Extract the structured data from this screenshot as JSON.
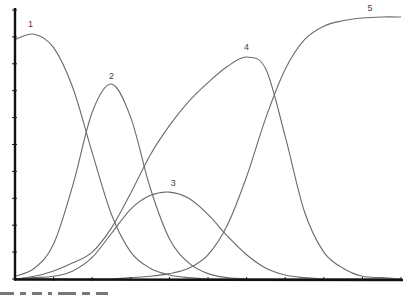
{
  "chart_data": {
    "type": "line",
    "title": "",
    "xlabel": "",
    "ylabel": "",
    "xlim": [
      0,
      10
    ],
    "ylim": [
      0,
      10
    ],
    "x_ticks": [
      0,
      1,
      2,
      3,
      4,
      5,
      6,
      7,
      8,
      9,
      10
    ],
    "y_ticks": [
      0,
      1,
      2,
      3,
      4,
      5,
      6,
      7,
      8,
      9,
      10
    ],
    "grid": false,
    "legend": "none (curves labeled inline 1-5)",
    "x": [
      0,
      0.5,
      1,
      1.5,
      2,
      2.5,
      3,
      3.5,
      4,
      4.5,
      5,
      5.5,
      6,
      6.5,
      7,
      7.5,
      8,
      8.5,
      9,
      9.5,
      10
    ],
    "series": [
      {
        "name": "1",
        "label_pos": [
          0.4,
          9.35
        ],
        "values": [
          8.9,
          9.1,
          8.6,
          7.1,
          4.7,
          2.4,
          1.0,
          0.4,
          0.15,
          0.05,
          0.0,
          0.0,
          0.0,
          0.0,
          0.0,
          0.0,
          0.0,
          0.0,
          0.0,
          0.0,
          0.0
        ]
      },
      {
        "name": "2",
        "label_pos": [
          2.5,
          7.45
        ],
        "values": [
          0.1,
          0.4,
          1.3,
          3.5,
          6.2,
          7.25,
          6.0,
          3.4,
          1.5,
          0.6,
          0.2,
          0.05,
          0.0,
          0.0,
          0.0,
          0.0,
          0.0,
          0.0,
          0.0,
          0.0,
          0.0
        ]
      },
      {
        "name": "3",
        "label_pos": [
          4.1,
          3.45
        ],
        "values": [
          0.0,
          0.05,
          0.1,
          0.3,
          0.8,
          1.7,
          2.6,
          3.1,
          3.23,
          3.0,
          2.4,
          1.6,
          0.9,
          0.4,
          0.15,
          0.05,
          0.0,
          0.0,
          0.0,
          0.0,
          0.0
        ]
      },
      {
        "name": "4",
        "label_pos": [
          6.0,
          8.5
        ],
        "values": [
          0.0,
          0.1,
          0.3,
          0.6,
          1.0,
          1.9,
          3.2,
          4.6,
          5.7,
          6.6,
          7.3,
          7.9,
          8.25,
          7.8,
          5.3,
          2.5,
          1.0,
          0.4,
          0.1,
          0.05,
          0.0
        ]
      },
      {
        "name": "5",
        "label_pos": [
          9.2,
          9.95
        ],
        "values": [
          0.0,
          0.0,
          0.0,
          0.0,
          0.0,
          0.0,
          0.05,
          0.1,
          0.2,
          0.4,
          0.9,
          2.0,
          3.8,
          6.0,
          7.8,
          8.9,
          9.4,
          9.6,
          9.7,
          9.74,
          9.74
        ]
      }
    ]
  }
}
